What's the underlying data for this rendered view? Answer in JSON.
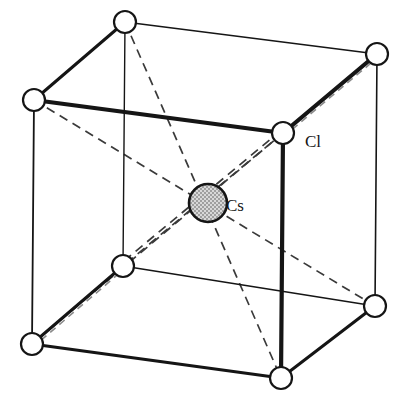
{
  "figure": {
    "name": "cesium-chloride-unit-cell",
    "background_color": "#ffffff",
    "line_color": "#151515",
    "atom_fill_anion": "#ffffff",
    "atom_fill_cation": "#d8d8d8"
  },
  "labels": [
    {
      "id": "cl",
      "text": "Cl",
      "x": 305,
      "y": 147
    },
    {
      "id": "cs",
      "text": "Cs",
      "x": 226,
      "y": 211
    }
  ],
  "atoms": [
    {
      "id": "v-top-back-left",
      "species": "Cl",
      "cx": 125,
      "cy": 22,
      "r": 11,
      "style": "open"
    },
    {
      "id": "v-top-back-right",
      "species": "Cl",
      "cx": 377,
      "cy": 54,
      "r": 11,
      "style": "open"
    },
    {
      "id": "v-top-front-left",
      "species": "Cl",
      "cx": 34,
      "cy": 100,
      "r": 11,
      "style": "open"
    },
    {
      "id": "v-top-front-right",
      "species": "Cl",
      "cx": 283,
      "cy": 133,
      "r": 11,
      "style": "open"
    },
    {
      "id": "v-bottom-back-left",
      "species": "Cl",
      "cx": 123,
      "cy": 266,
      "r": 11,
      "style": "open"
    },
    {
      "id": "v-bottom-back-right",
      "species": "Cl",
      "cx": 375,
      "cy": 306,
      "r": 11,
      "style": "open"
    },
    {
      "id": "v-bottom-front-left",
      "species": "Cl",
      "cx": 32,
      "cy": 344,
      "r": 11,
      "style": "open"
    },
    {
      "id": "v-bottom-front-right",
      "species": "Cl",
      "cx": 281,
      "cy": 378,
      "r": 11,
      "style": "open"
    },
    {
      "id": "center-cs",
      "species": "Cs",
      "cx": 208,
      "cy": 203,
      "r": 19,
      "style": "stippled"
    }
  ],
  "edges": [
    {
      "id": "edge-top-back",
      "x1": 125,
      "y1": 22,
      "x2": 377,
      "y2": 54,
      "weight": 1.6,
      "kind": "solid"
    },
    {
      "id": "edge-top-left-back",
      "x1": 34,
      "y1": 100,
      "x2": 125,
      "y2": 22,
      "weight": 3.0,
      "kind": "solid"
    },
    {
      "id": "edge-top-front",
      "x1": 34,
      "y1": 100,
      "x2": 283,
      "y2": 133,
      "weight": 4.2,
      "kind": "solid"
    },
    {
      "id": "edge-top-right-back",
      "x1": 283,
      "y1": 133,
      "x2": 377,
      "y2": 54,
      "weight": 4.2,
      "kind": "solid"
    },
    {
      "id": "edge-vert-front-left",
      "x1": 34,
      "y1": 100,
      "x2": 32,
      "y2": 344,
      "weight": 1.8,
      "kind": "solid"
    },
    {
      "id": "edge-vert-back-left",
      "x1": 125,
      "y1": 22,
      "x2": 123,
      "y2": 266,
      "weight": 1.4,
      "kind": "solid"
    },
    {
      "id": "edge-vert-front-right",
      "x1": 283,
      "y1": 133,
      "x2": 281,
      "y2": 378,
      "weight": 4.2,
      "kind": "solid"
    },
    {
      "id": "edge-vert-back-right",
      "x1": 377,
      "y1": 54,
      "x2": 375,
      "y2": 306,
      "weight": 1.6,
      "kind": "solid"
    },
    {
      "id": "edge-bottom-back",
      "x1": 123,
      "y1": 266,
      "x2": 375,
      "y2": 306,
      "weight": 1.4,
      "kind": "solid"
    },
    {
      "id": "edge-bottom-left-back",
      "x1": 32,
      "y1": 344,
      "x2": 123,
      "y2": 266,
      "weight": 3.0,
      "kind": "solid"
    },
    {
      "id": "edge-bottom-front",
      "x1": 32,
      "y1": 344,
      "x2": 281,
      "y2": 378,
      "weight": 3.0,
      "kind": "solid"
    },
    {
      "id": "edge-bottom-right-back",
      "x1": 281,
      "y1": 378,
      "x2": 375,
      "y2": 306,
      "weight": 3.0,
      "kind": "solid"
    }
  ],
  "body_diagonals": [
    {
      "id": "diag-top-back-left-to-bottom-front-right",
      "x1": 125,
      "y1": 22,
      "x2": 281,
      "y2": 378,
      "double": false
    },
    {
      "id": "diag-top-back-right-to-bottom-front-left",
      "x1": 377,
      "y1": 54,
      "x2": 32,
      "y2": 344,
      "double": false
    },
    {
      "id": "diag-top-front-left-to-bottom-back-right",
      "x1": 34,
      "y1": 100,
      "x2": 375,
      "y2": 306,
      "double": false
    },
    {
      "id": "diag-top-front-right-to-bottom-back-left",
      "x1": 283,
      "y1": 133,
      "x2": 123,
      "y2": 266,
      "double": true
    }
  ],
  "ghost_dashes": [
    {
      "id": "ghost-top-right-back-edge",
      "x1": 283,
      "y1": 137,
      "x2": 377,
      "y2": 58
    },
    {
      "id": "ghost-bottom-left-edge",
      "x1": 32,
      "y1": 348,
      "x2": 123,
      "y2": 270
    }
  ]
}
